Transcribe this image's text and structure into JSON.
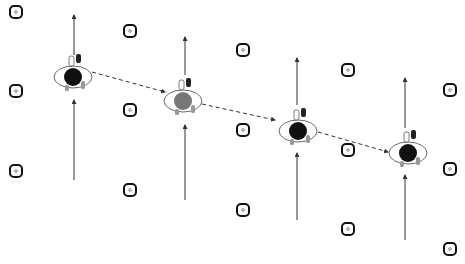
{
  "diagram": {
    "colors": {
      "background": "#ffffff",
      "line": "#333333",
      "marker": "#111111",
      "head_dark": "#111111",
      "head_gray": "#777777"
    },
    "markers": [
      {
        "x": 16,
        "y": 12
      },
      {
        "x": 16,
        "y": 91
      },
      {
        "x": 16,
        "y": 171
      },
      {
        "x": 130,
        "y": 31
      },
      {
        "x": 130,
        "y": 110
      },
      {
        "x": 130,
        "y": 190
      },
      {
        "x": 243,
        "y": 50
      },
      {
        "x": 243,
        "y": 130
      },
      {
        "x": 243,
        "y": 210
      },
      {
        "x": 348,
        "y": 70
      },
      {
        "x": 348,
        "y": 150
      },
      {
        "x": 348,
        "y": 229
      },
      {
        "x": 450,
        "y": 90
      },
      {
        "x": 450,
        "y": 169
      },
      {
        "x": 450,
        "y": 249
      }
    ],
    "players": [
      {
        "x": 73,
        "y": 76,
        "head": "dark"
      },
      {
        "x": 183,
        "y": 100,
        "head": "gray"
      },
      {
        "x": 298,
        "y": 130,
        "head": "dark"
      },
      {
        "x": 408,
        "y": 152,
        "head": "dark"
      }
    ],
    "arrows": [
      {
        "x": 74,
        "y1": 180,
        "y2": 100
      },
      {
        "x": 74,
        "y1": 55,
        "y2": 15
      },
      {
        "x": 185,
        "y1": 200,
        "y2": 125
      },
      {
        "x": 185,
        "y1": 75,
        "y2": 37
      },
      {
        "x": 297,
        "y1": 220,
        "y2": 153
      },
      {
        "x": 297,
        "y1": 105,
        "y2": 58
      },
      {
        "x": 405,
        "y1": 240,
        "y2": 175
      },
      {
        "x": 405,
        "y1": 128,
        "y2": 78
      }
    ],
    "path": [
      [
        92,
        72
      ],
      [
        165,
        92
      ],
      [
        202,
        104
      ],
      [
        275,
        120
      ],
      [
        318,
        132
      ],
      [
        388,
        152
      ]
    ]
  }
}
